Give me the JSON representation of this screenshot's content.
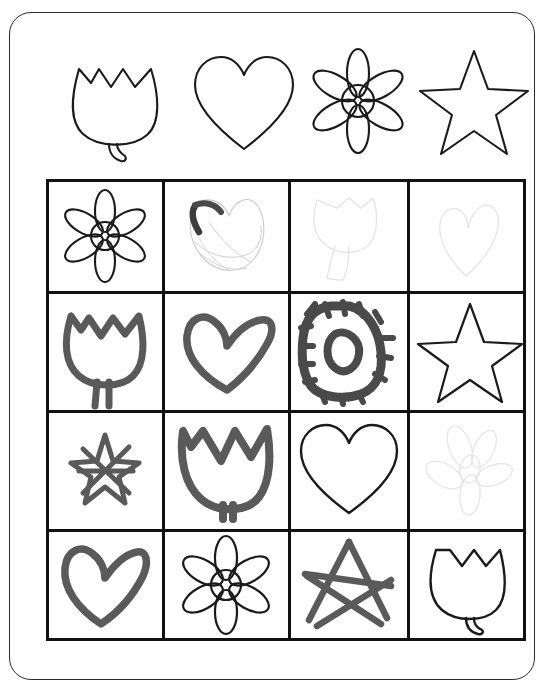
{
  "worksheet": {
    "title": "Shape Matching Worksheet",
    "background_color": "#ffffff",
    "card": {
      "border_color": "#2b2b2b",
      "corner_radius": 22
    }
  },
  "legend": {
    "name": "reference-shapes-row",
    "shapes": [
      {
        "id": "tulip",
        "label": "Tulip",
        "style": "outline",
        "ink": "#1a1a1a"
      },
      {
        "id": "heart",
        "label": "Heart",
        "style": "outline",
        "ink": "#1a1a1a"
      },
      {
        "id": "flower",
        "label": "Flower",
        "style": "outline",
        "ink": "#1a1a1a"
      },
      {
        "id": "star",
        "label": "Star",
        "style": "outline",
        "ink": "#1a1a1a"
      }
    ]
  },
  "grid": {
    "name": "drawing-grid",
    "rows": 4,
    "columns": 4,
    "border_color": "#111111",
    "cells": [
      {
        "row": 1,
        "col": 1,
        "shape": "flower",
        "style": "outline",
        "ink": "#1a1a1a",
        "label": "Flower outline"
      },
      {
        "row": 1,
        "col": 2,
        "shape": "heart",
        "style": "scribble",
        "ink": "#bdbdbd",
        "label": "Faint scribbled heart"
      },
      {
        "row": 1,
        "col": 3,
        "shape": "tulip",
        "style": "faint",
        "ink": "#e0e0e0",
        "label": "Very faint tulip sketch"
      },
      {
        "row": 1,
        "col": 4,
        "shape": "heart",
        "style": "faint",
        "ink": "#e4e4e4",
        "label": "Very faint heart sketch"
      },
      {
        "row": 2,
        "col": 1,
        "shape": "tulip",
        "style": "marker",
        "ink": "#5a5a5a",
        "label": "Marker tulip"
      },
      {
        "row": 2,
        "col": 2,
        "shape": "heart",
        "style": "marker",
        "ink": "#5a5a5a",
        "label": "Marker heart"
      },
      {
        "row": 2,
        "col": 3,
        "shape": "flower",
        "style": "heavy",
        "ink": "#4a4a4a",
        "label": "Heavy marker flower"
      },
      {
        "row": 2,
        "col": 4,
        "shape": "star",
        "style": "outline",
        "ink": "#1a1a1a",
        "label": "Star outline"
      },
      {
        "row": 3,
        "col": 1,
        "shape": "star",
        "style": "marker",
        "ink": "#5a5a5a",
        "label": "Small marker star"
      },
      {
        "row": 3,
        "col": 2,
        "shape": "tulip",
        "style": "marker",
        "ink": "#5a5a5a",
        "label": "Marker tulip"
      },
      {
        "row": 3,
        "col": 3,
        "shape": "heart",
        "style": "outline",
        "ink": "#1a1a1a",
        "label": "Heart outline"
      },
      {
        "row": 3,
        "col": 4,
        "shape": "flower",
        "style": "faint",
        "ink": "#e4e4e4",
        "label": "Very faint flower sketch"
      },
      {
        "row": 4,
        "col": 1,
        "shape": "heart",
        "style": "marker",
        "ink": "#5a5a5a",
        "label": "Marker heart"
      },
      {
        "row": 4,
        "col": 2,
        "shape": "flower",
        "style": "outline",
        "ink": "#1a1a1a",
        "label": "Flower outline"
      },
      {
        "row": 4,
        "col": 3,
        "shape": "star",
        "style": "marker",
        "ink": "#5a5a5a",
        "label": "Marker star"
      },
      {
        "row": 4,
        "col": 4,
        "shape": "tulip",
        "style": "outline",
        "ink": "#1a1a1a",
        "label": "Tulip outline"
      }
    ]
  }
}
